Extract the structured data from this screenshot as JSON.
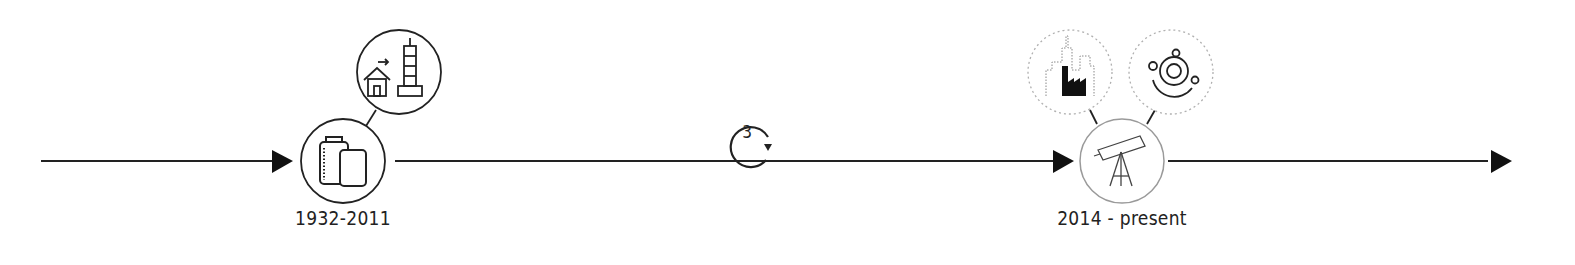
{
  "timeline": {
    "milestones": [
      {
        "id": "milestone-1",
        "label": "1932-2011",
        "icon": "film-canisters-icon",
        "related": [
          {
            "icon": "house-to-skyscraper-icon",
            "style": "solid"
          }
        ]
      },
      {
        "id": "milestone-2",
        "label": "2014 - present",
        "icon": "telescope-icon",
        "related": [
          {
            "icon": "city-factory-icon",
            "style": "dotted"
          },
          {
            "icon": "orbit-icon",
            "style": "dotted"
          }
        ]
      }
    ],
    "cycle": {
      "icon": "cycle-arrow-icon",
      "value": "3"
    },
    "colors": {
      "line": "#222222",
      "arrow": "#111111",
      "muted_circle": "#9a9a9a",
      "dotted_circle": "#b0b0b0"
    }
  }
}
